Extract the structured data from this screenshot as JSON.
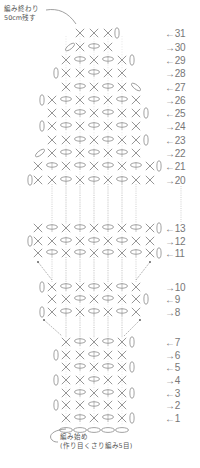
{
  "annotations": {
    "end_line1": "編み終わり",
    "end_line2": "50cm残す",
    "start_line1": "編み始め",
    "start_line2": "(作り目くさり編み5目)"
  },
  "colors": {
    "stitch": "#8a8a8a",
    "dotted": "#b0b0b0",
    "label": "#777777"
  },
  "legend_symbols": {
    "x": "single-crochet",
    "o": "chain-stitch",
    "v": "turning-chain-vertical",
    "d": "turning-chain-diagonal"
  },
  "rows": [
    {
      "n": "31",
      "dir": "←",
      "y": 33,
      "st": [
        [
          "x",
          80
        ],
        [
          "x",
          94
        ],
        [
          "x",
          108
        ],
        [
          "v",
          117
        ]
      ]
    },
    {
      "n": "30",
      "dir": "→",
      "y": 47,
      "st": [
        [
          "d",
          70
        ],
        [
          "x",
          80
        ],
        [
          "o",
          94
        ],
        [
          "x",
          108
        ]
      ]
    },
    {
      "n": "29",
      "dir": "←",
      "y": 60,
      "st": [
        [
          "x",
          66
        ],
        [
          "o",
          80
        ],
        [
          "x",
          94
        ],
        [
          "o",
          108
        ],
        [
          "x",
          122
        ],
        [
          "v",
          132
        ]
      ]
    },
    {
      "n": "28",
      "dir": "→",
      "y": 73,
      "st": [
        [
          "v",
          56
        ],
        [
          "x",
          66
        ],
        [
          "x",
          80
        ],
        [
          "o",
          94
        ],
        [
          "x",
          108
        ],
        [
          "x",
          122
        ]
      ]
    },
    {
      "n": "27",
      "dir": "←",
      "y": 87,
      "st": [
        [
          "x",
          66
        ],
        [
          "o",
          80
        ],
        [
          "x",
          94
        ],
        [
          "o",
          108
        ],
        [
          "x",
          122
        ],
        [
          "d",
          136
        ]
      ]
    },
    {
      "n": "26",
      "dir": "→",
      "y": 100,
      "st": [
        [
          "v",
          42
        ],
        [
          "x",
          52
        ],
        [
          "o",
          66
        ],
        [
          "x",
          80
        ],
        [
          "o",
          94
        ],
        [
          "x",
          108
        ],
        [
          "o",
          122
        ],
        [
          "x",
          136
        ]
      ]
    },
    {
      "n": "25",
      "dir": "←",
      "y": 113,
      "st": [
        [
          "x",
          52
        ],
        [
          "x",
          66
        ],
        [
          "o",
          80
        ],
        [
          "x",
          94
        ],
        [
          "o",
          108
        ],
        [
          "x",
          122
        ],
        [
          "x",
          136
        ],
        [
          "v",
          146
        ]
      ]
    },
    {
      "n": "24",
      "dir": "→",
      "y": 126,
      "st": [
        [
          "v",
          42
        ],
        [
          "x",
          52
        ],
        [
          "o",
          66
        ],
        [
          "x",
          80
        ],
        [
          "o",
          94
        ],
        [
          "x",
          108
        ],
        [
          "o",
          122
        ],
        [
          "x",
          136
        ]
      ]
    },
    {
      "n": "23",
      "dir": "←",
      "y": 140,
      "st": [
        [
          "x",
          52
        ],
        [
          "x",
          66
        ],
        [
          "o",
          80
        ],
        [
          "x",
          94
        ],
        [
          "o",
          108
        ],
        [
          "x",
          122
        ],
        [
          "x",
          136
        ],
        [
          "v",
          146
        ]
      ]
    },
    {
      "n": "22",
      "dir": "→",
      "y": 153,
      "st": [
        [
          "d",
          40
        ],
        [
          "x",
          52
        ],
        [
          "o",
          66
        ],
        [
          "x",
          80
        ],
        [
          "o",
          94
        ],
        [
          "x",
          108
        ],
        [
          "o",
          122
        ],
        [
          "x",
          136
        ]
      ]
    },
    {
      "n": "21",
      "dir": "←",
      "y": 166,
      "st": [
        [
          "x",
          38
        ],
        [
          "o",
          52
        ],
        [
          "x",
          66
        ],
        [
          "o",
          80
        ],
        [
          "x",
          94
        ],
        [
          "o",
          108
        ],
        [
          "x",
          122
        ],
        [
          "o",
          136
        ],
        [
          "x",
          150
        ],
        [
          "v",
          159
        ]
      ]
    },
    {
      "n": "20",
      "dir": "→",
      "y": 180,
      "st": [
        [
          "v",
          30
        ],
        [
          "x",
          38
        ],
        [
          "x",
          52
        ],
        [
          "o",
          66
        ],
        [
          "x",
          80
        ],
        [
          "o",
          94
        ],
        [
          "x",
          108
        ],
        [
          "o",
          122
        ],
        [
          "x",
          136
        ],
        [
          "x",
          150
        ]
      ]
    },
    {
      "n": "13",
      "dir": "←",
      "y": 228,
      "st": [
        [
          "x",
          38
        ],
        [
          "o",
          52
        ],
        [
          "x",
          66
        ],
        [
          "o",
          80
        ],
        [
          "x",
          94
        ],
        [
          "o",
          108
        ],
        [
          "x",
          122
        ],
        [
          "o",
          136
        ],
        [
          "x",
          150
        ],
        [
          "v",
          159
        ]
      ]
    },
    {
      "n": "12",
      "dir": "→",
      "y": 241,
      "st": [
        [
          "v",
          30
        ],
        [
          "x",
          38
        ],
        [
          "x",
          52
        ],
        [
          "o",
          66
        ],
        [
          "x",
          80
        ],
        [
          "o",
          94
        ],
        [
          "x",
          108
        ],
        [
          "o",
          122
        ],
        [
          "x",
          136
        ],
        [
          "x",
          150
        ]
      ]
    },
    {
      "n": "11",
      "dir": "←",
      "y": 253,
      "st": [
        [
          "x",
          38
        ],
        [
          "o",
          52
        ],
        [
          "x",
          66
        ],
        [
          "o",
          80
        ],
        [
          "x",
          94
        ],
        [
          "o",
          108
        ],
        [
          "x",
          122
        ],
        [
          "o",
          136
        ],
        [
          "x",
          150
        ],
        [
          "v",
          159
        ]
      ]
    },
    {
      "n": "10",
      "dir": "→",
      "y": 287,
      "st": [
        [
          "v",
          42
        ],
        [
          "x",
          52
        ],
        [
          "o",
          66
        ],
        [
          "x",
          80
        ],
        [
          "o",
          94
        ],
        [
          "x",
          108
        ],
        [
          "o",
          122
        ],
        [
          "x",
          136
        ]
      ]
    },
    {
      "n": "9",
      "dir": "←",
      "y": 299,
      "st": [
        [
          "x",
          52
        ],
        [
          "x",
          66
        ],
        [
          "o",
          80
        ],
        [
          "x",
          94
        ],
        [
          "o",
          108
        ],
        [
          "x",
          122
        ],
        [
          "x",
          136
        ],
        [
          "v",
          146
        ]
      ]
    },
    {
      "n": "8",
      "dir": "→",
      "y": 312,
      "st": [
        [
          "v",
          42
        ],
        [
          "x",
          52
        ],
        [
          "o",
          66
        ],
        [
          "x",
          80
        ],
        [
          "o",
          94
        ],
        [
          "x",
          108
        ],
        [
          "o",
          122
        ],
        [
          "x",
          136
        ]
      ]
    },
    {
      "n": "7",
      "dir": "←",
      "y": 342,
      "st": [
        [
          "x",
          66
        ],
        [
          "o",
          80
        ],
        [
          "x",
          94
        ],
        [
          "o",
          108
        ],
        [
          "x",
          122
        ],
        [
          "v",
          132
        ]
      ]
    },
    {
      "n": "6",
      "dir": "→",
      "y": 355,
      "st": [
        [
          "v",
          56
        ],
        [
          "x",
          66
        ],
        [
          "x",
          80
        ],
        [
          "o",
          94
        ],
        [
          "x",
          108
        ],
        [
          "x",
          122
        ]
      ]
    },
    {
      "n": "5",
      "dir": "←",
      "y": 367,
      "st": [
        [
          "x",
          66
        ],
        [
          "o",
          80
        ],
        [
          "x",
          94
        ],
        [
          "o",
          108
        ],
        [
          "x",
          122
        ],
        [
          "v",
          132
        ]
      ]
    },
    {
      "n": "4",
      "dir": "→",
      "y": 380,
      "st": [
        [
          "v",
          56
        ],
        [
          "x",
          66
        ],
        [
          "x",
          80
        ],
        [
          "o",
          94
        ],
        [
          "x",
          108
        ],
        [
          "x",
          122
        ]
      ]
    },
    {
      "n": "3",
      "dir": "←",
      "y": 393,
      "st": [
        [
          "x",
          66
        ],
        [
          "o",
          80
        ],
        [
          "x",
          94
        ],
        [
          "o",
          108
        ],
        [
          "x",
          122
        ],
        [
          "v",
          132
        ]
      ]
    },
    {
      "n": "2",
      "dir": "→",
      "y": 405,
      "st": [
        [
          "v",
          56
        ],
        [
          "x",
          66
        ],
        [
          "x",
          80
        ],
        [
          "o",
          94
        ],
        [
          "x",
          108
        ],
        [
          "x",
          122
        ]
      ]
    },
    {
      "n": "1",
      "dir": "←",
      "y": 418,
      "st": [
        [
          "x",
          66
        ],
        [
          "o",
          80
        ],
        [
          "x",
          94
        ],
        [
          "o",
          108
        ],
        [
          "x",
          122
        ],
        [
          "v",
          132
        ]
      ]
    }
  ],
  "foundation_chain": {
    "y": 430,
    "x": [
      66,
      80,
      94,
      108,
      122
    ],
    "count": "5"
  },
  "dotted_columns": [
    66,
    80,
    94,
    108,
    122
  ],
  "wide_dotted_columns": [
    52,
    66,
    80,
    94,
    108,
    122,
    136
  ],
  "side_dotted_column": 181,
  "diagonal_links": [
    {
      "x1": 38,
      "y1": 262,
      "x2": 52,
      "y2": 280
    },
    {
      "x1": 150,
      "y1": 262,
      "x2": 136,
      "y2": 280
    },
    {
      "x1": 44,
      "y1": 320,
      "x2": 62,
      "y2": 336
    },
    {
      "x1": 140,
      "y1": 320,
      "x2": 124,
      "y2": 336
    }
  ]
}
